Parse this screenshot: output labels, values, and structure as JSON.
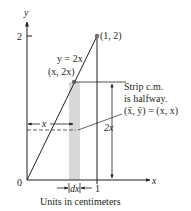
{
  "axes": {
    "x_label": "x",
    "y_label": "y",
    "origin_label": "0",
    "x_tick_label": "1",
    "y_tick_label": "2"
  },
  "curve": {
    "equation_label": "y = 2x",
    "point_label": "(x, 2x)",
    "endpoint_label": "(1, 2)"
  },
  "strip": {
    "width_label": "dx",
    "height_label": "2x",
    "distance_label": "x",
    "note_line1": "Strip c.m.",
    "note_line2": "is halfway.",
    "note_line3": "(x̄, ȳ) = (x, x)"
  },
  "caption": "Units in centimeters",
  "colors": {
    "ink": "#231f20",
    "strip_fill": "#d9d9d9"
  }
}
